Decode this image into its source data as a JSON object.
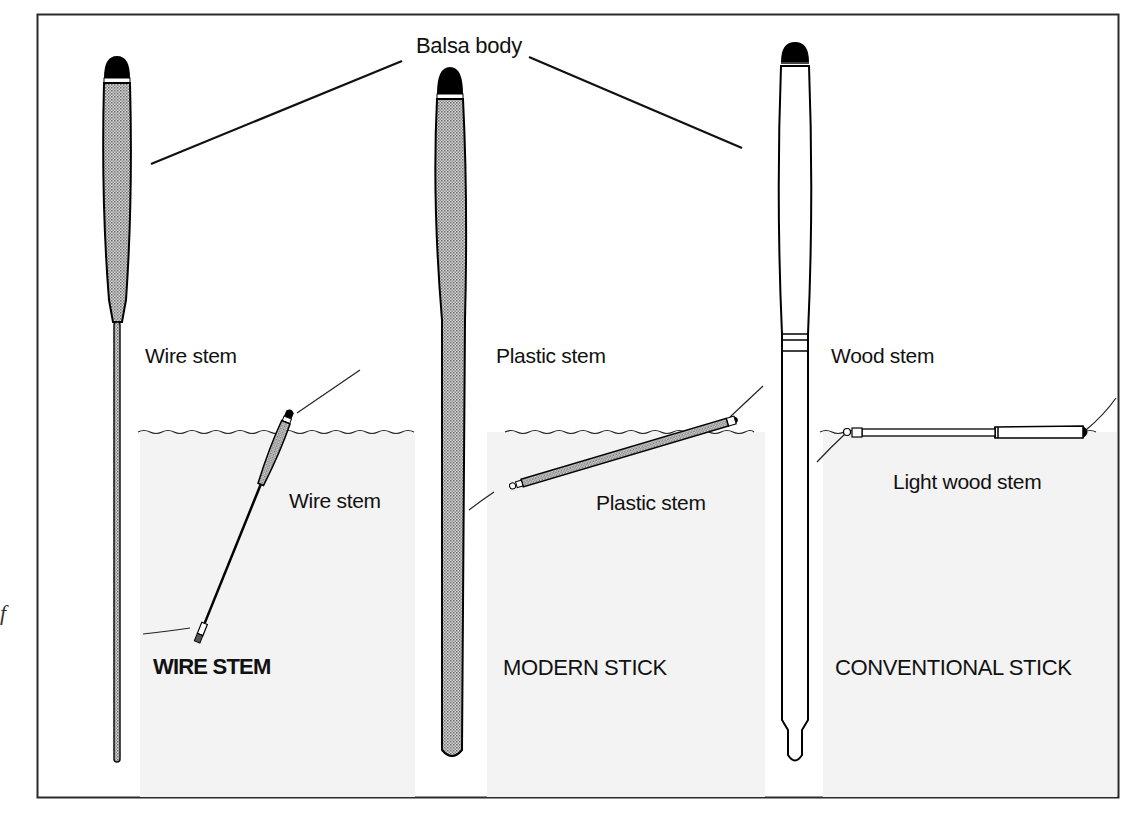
{
  "figure": {
    "top_label": "Balsa body",
    "margin_fragment": "f",
    "colors": {
      "frame": "#2a2a2a",
      "ink": "#111111",
      "water": "#f3f3f3",
      "stipple": "#8a8a8a",
      "background": "#ffffff"
    },
    "panels": [
      {
        "id": "wire-stem",
        "stem_label": "Wire stem",
        "inwater_label": "Wire stem",
        "caption": "WIRE STEM"
      },
      {
        "id": "modern-stick",
        "stem_label": "Plastic stem",
        "inwater_label": "Plastic stem",
        "caption": "MODERN STICK"
      },
      {
        "id": "conventional-stick",
        "stem_label": "Wood stem",
        "inwater_label": "Light wood stem",
        "caption": "CONVENTIONAL STICK"
      }
    ]
  }
}
